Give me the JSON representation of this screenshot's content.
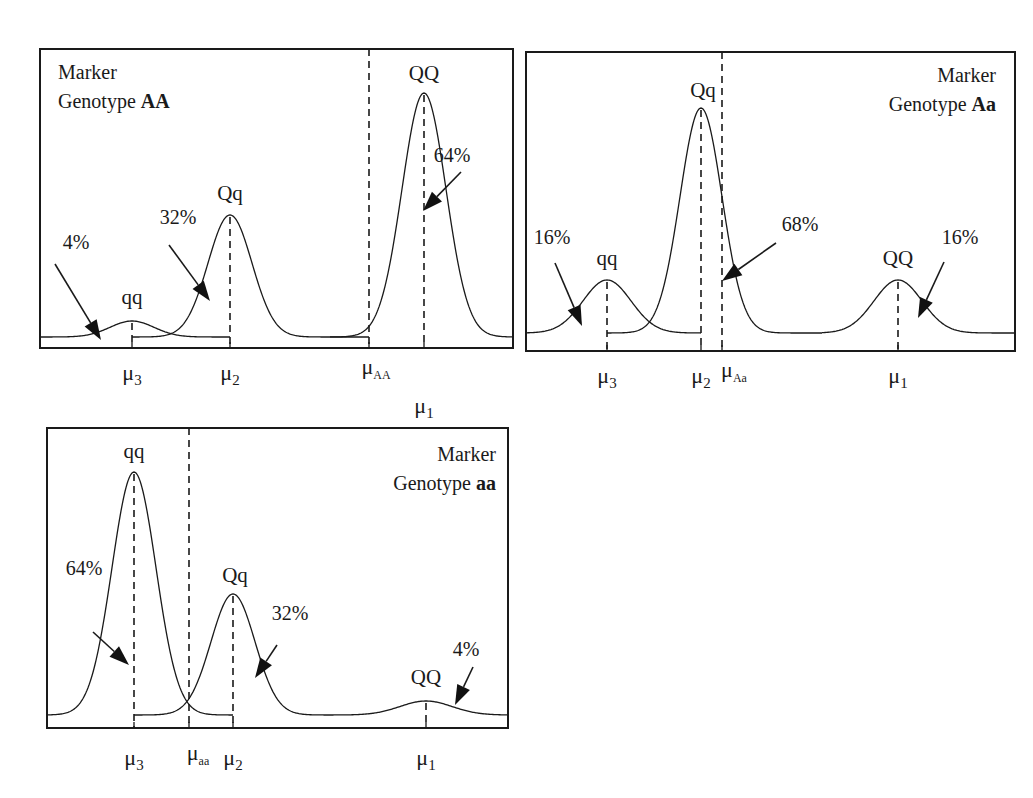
{
  "figure": {
    "colors": {
      "ink": "#1a1a1a",
      "background": "#ffffff"
    }
  },
  "panels": [
    {
      "id": "AA",
      "title_line1": "Marker",
      "title_line2_prefix": "Genotype ",
      "title_line2_bold": "AA",
      "marker_mean_label": {
        "base": "μ",
        "sub": "AA"
      },
      "components": [
        {
          "genotype": "qq",
          "mean_label": {
            "base": "μ",
            "sub": "3"
          },
          "proportion_label": "4%",
          "proportion": 0.04
        },
        {
          "genotype": "Qq",
          "mean_label": {
            "base": "μ",
            "sub": "2"
          },
          "proportion_label": "32%",
          "proportion": 0.32
        },
        {
          "genotype": "QQ",
          "mean_label": {
            "base": "μ",
            "sub": "1"
          },
          "proportion_label": "64%",
          "proportion": 0.64
        }
      ]
    },
    {
      "id": "Aa",
      "title_line1": "Marker",
      "title_line2_prefix": "Genotype ",
      "title_line2_bold": "Aa",
      "marker_mean_label": {
        "base": "μ",
        "sub": "Aa"
      },
      "components": [
        {
          "genotype": "qq",
          "mean_label": {
            "base": "μ",
            "sub": "3"
          },
          "proportion_label": "16%",
          "proportion": 0.16
        },
        {
          "genotype": "Qq",
          "mean_label": {
            "base": "μ",
            "sub": "2"
          },
          "proportion_label": "68%",
          "proportion": 0.68
        },
        {
          "genotype": "QQ",
          "mean_label": {
            "base": "μ",
            "sub": "1"
          },
          "proportion_label": "16%",
          "proportion": 0.16
        }
      ]
    },
    {
      "id": "aa",
      "title_line1": "Marker",
      "title_line2_prefix": "Genotype ",
      "title_line2_bold": "aa",
      "marker_mean_label": {
        "base": "μ",
        "sub": "aa"
      },
      "components": [
        {
          "genotype": "qq",
          "mean_label": {
            "base": "μ",
            "sub": "3"
          },
          "proportion_label": "64%",
          "proportion": 0.64
        },
        {
          "genotype": "Qq",
          "mean_label": {
            "base": "μ",
            "sub": "2"
          },
          "proportion_label": "32%",
          "proportion": 0.32
        },
        {
          "genotype": "QQ",
          "mean_label": {
            "base": "μ",
            "sub": "1"
          },
          "proportion_label": "4%",
          "proportion": 0.04
        }
      ]
    }
  ]
}
